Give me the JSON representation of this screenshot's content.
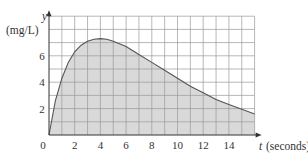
{
  "chart_data": {
    "type": "area",
    "title": "",
    "xlabel": "t (seconds)",
    "xlabel_var": "t",
    "xlabel_unit": "(seconds)",
    "ylabel_var": "y",
    "ylabel_unit": "(mg/L)",
    "xlim": [
      0,
      16
    ],
    "ylim": [
      0,
      9
    ],
    "grid": true,
    "x_ticks": [
      "0",
      "2",
      "4",
      "6",
      "8",
      "10",
      "12",
      "14"
    ],
    "y_ticks": [
      "2",
      "4",
      "6"
    ],
    "x": [
      0,
      0.5,
      1,
      1.5,
      2,
      2.5,
      3,
      3.5,
      4,
      4.5,
      5,
      6,
      7,
      8,
      9,
      10,
      11,
      12,
      13,
      14,
      15,
      16
    ],
    "values": [
      0,
      2.6,
      4.3,
      5.5,
      6.3,
      6.8,
      7.1,
      7.25,
      7.3,
      7.25,
      7.1,
      6.7,
      6.1,
      5.5,
      4.9,
      4.3,
      3.7,
      3.2,
      2.7,
      2.3,
      1.95,
      1.6
    ],
    "fill": "#d9d9d9",
    "line_color": "#555555",
    "grid_color": "#9a9a9a"
  }
}
